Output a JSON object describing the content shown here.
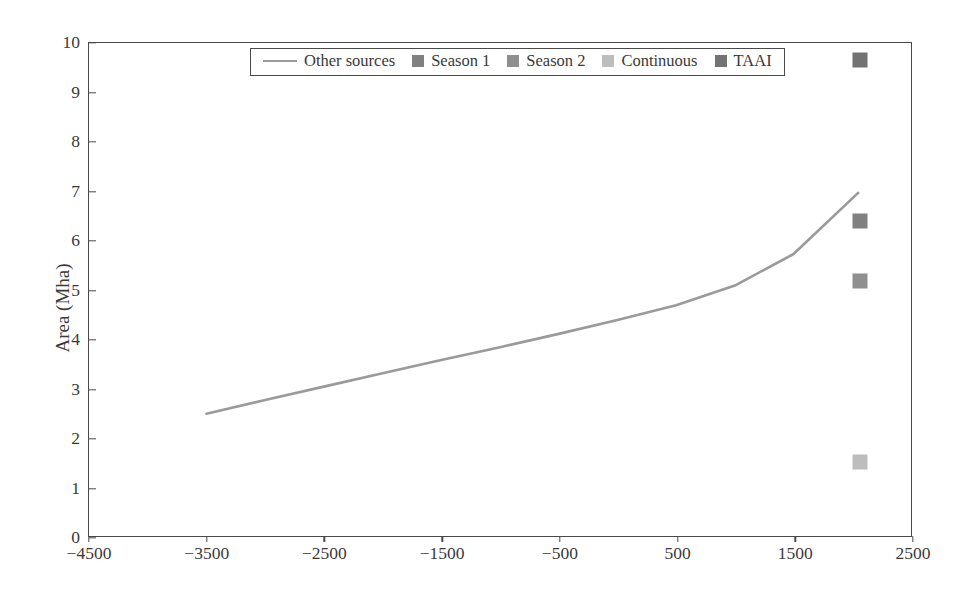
{
  "chart_data": {
    "type": "line",
    "title": "",
    "xlabel": "",
    "ylabel": "Area (Mha)",
    "xlim": [
      -4500,
      2500
    ],
    "ylim": [
      0,
      10
    ],
    "grid": false,
    "legend_position": "top-center",
    "xticks": [
      -4500,
      -3500,
      -2500,
      -1500,
      -500,
      500,
      1500,
      2500
    ],
    "xtick_labels": [
      "−4500",
      "−3500",
      "−2500",
      "−1500",
      "−500",
      "500",
      "1500",
      "2500"
    ],
    "yticks": [
      0,
      1,
      2,
      3,
      4,
      5,
      6,
      7,
      8,
      9,
      10
    ],
    "ytick_labels": [
      "0",
      "1",
      "2",
      "3",
      "4",
      "5",
      "6",
      "7",
      "8",
      "9",
      "10"
    ],
    "series": [
      {
        "name": "Other sources",
        "type": "line",
        "color": "#9a9a9a",
        "x": [
          -3500,
          -3000,
          -2500,
          -2000,
          -1500,
          -1000,
          -500,
          0,
          500,
          1000,
          1500,
          2050
        ],
        "y": [
          2.48,
          2.76,
          3.03,
          3.3,
          3.57,
          3.83,
          4.1,
          4.38,
          4.68,
          5.08,
          5.72,
          6.96
        ]
      },
      {
        "name": "Season 1",
        "type": "scatter",
        "color": "#808080",
        "x": [
          2050
        ],
        "y": [
          6.4
        ]
      },
      {
        "name": "Season 2",
        "type": "scatter",
        "color": "#8f8f8f",
        "x": [
          2050
        ],
        "y": [
          5.2
        ]
      },
      {
        "name": "Continuous",
        "type": "scatter",
        "color": "#bdbdbd",
        "x": [
          2050
        ],
        "y": [
          1.53
        ]
      },
      {
        "name": "TAAI",
        "type": "scatter",
        "color": "#737373",
        "x": [
          2050
        ],
        "y": [
          9.65
        ]
      }
    ]
  },
  "legend": {
    "entries": [
      {
        "label": "Other sources",
        "marker": "line",
        "color": "#9a9a9a"
      },
      {
        "label": "Season 1",
        "marker": "square",
        "color": "#808080"
      },
      {
        "label": "Season 2",
        "marker": "square",
        "color": "#8f8f8f"
      },
      {
        "label": "Continuous",
        "marker": "square",
        "color": "#bdbdbd"
      },
      {
        "label": "TAAI",
        "marker": "square",
        "color": "#737373"
      }
    ]
  },
  "axes": {
    "y_title": "Area (Mha)",
    "axis_color": "#4a4a4a",
    "text_color": "#3a3a3a"
  }
}
